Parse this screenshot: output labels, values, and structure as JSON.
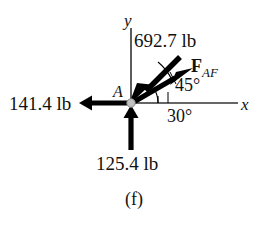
{
  "figure": {
    "caption": "(f)",
    "type": "free-body-diagram",
    "origin_point_label": "A",
    "axes": {
      "x_label": "x",
      "y_label": "y"
    },
    "forces": [
      {
        "id": "force-692",
        "label": "692.7 lb",
        "magnitude": 692.7,
        "unit": "lb",
        "direction_deg": 225,
        "description": "arrow pointing down-left into point A along 45 degree line"
      },
      {
        "id": "force-faf",
        "label": "F_AF",
        "label_main": "F",
        "label_sub": "AF",
        "direction_deg": 30,
        "description": "arrow pointing up-right from point A at 30 degrees above x-axis"
      },
      {
        "id": "force-141",
        "label": "141.4 lb",
        "magnitude": 141.4,
        "unit": "lb",
        "direction_deg": 180,
        "description": "arrow pointing left from point A along negative x-axis"
      },
      {
        "id": "force-125",
        "label": "125.4 lb",
        "magnitude": 125.4,
        "unit": "lb",
        "direction_deg": 90,
        "description": "arrow pointing up into point A along positive y direction"
      }
    ],
    "angles": [
      {
        "id": "angle-45",
        "label": "45°",
        "value": 45,
        "unit": "deg"
      },
      {
        "id": "angle-30",
        "label": "30°",
        "value": 30,
        "unit": "deg"
      }
    ],
    "colors": {
      "stroke": "#000000",
      "background": "#ffffff",
      "pin": "#b9b9b9",
      "axis": "#3a3a3a"
    }
  }
}
